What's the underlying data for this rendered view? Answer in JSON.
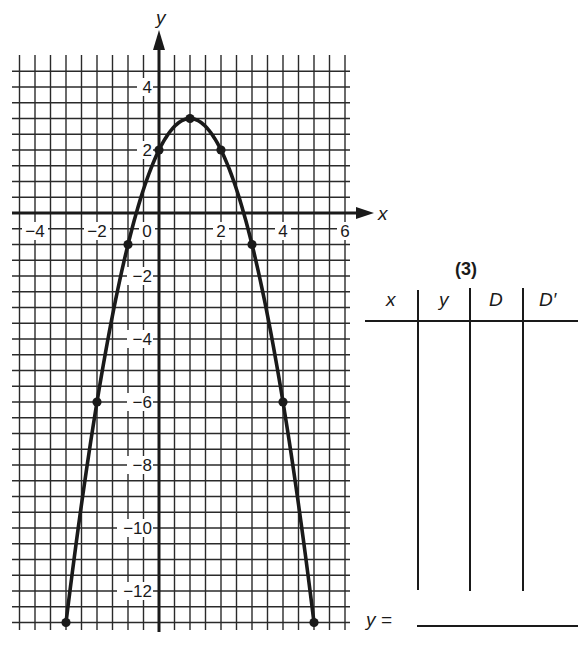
{
  "chart_data": {
    "type": "line",
    "title": "",
    "xlabel": "x",
    "ylabel": "y",
    "xlim": [
      -4.75,
      6
    ],
    "ylim": [
      -13.3,
      5
    ],
    "grid": true,
    "grid_step": 0.5,
    "x_ticks": [
      -4,
      -2,
      0,
      2,
      4,
      6
    ],
    "x_tick_labels": [
      "−4",
      "−2",
      "0",
      "2",
      "4",
      "6"
    ],
    "y_ticks": [
      4,
      2,
      -2,
      -4,
      -6,
      -8,
      -10,
      -12
    ],
    "y_tick_labels": [
      "4",
      "2",
      "−2",
      "−4",
      "−6",
      "−8",
      "−10",
      "−12"
    ],
    "series": [
      {
        "name": "parabola",
        "equation_hint": "y = 3 - (x - 1)^2",
        "x": [
          -3,
          -2,
          -1,
          0,
          1,
          2,
          3,
          4,
          5
        ],
        "y": [
          -13,
          -6,
          -1,
          2,
          3,
          2,
          -1,
          -6,
          -13
        ],
        "markers": true,
        "color": "#1a1a1a"
      }
    ],
    "legend": null
  },
  "table": {
    "title": "(3)",
    "columns": [
      "x",
      "y",
      "D",
      "D′"
    ],
    "rows": []
  },
  "answer": {
    "label": "y =",
    "value": ""
  },
  "colors": {
    "ink": "#1a1a1a",
    "grid": "#2a2a2a",
    "paper": "#ffffff"
  }
}
